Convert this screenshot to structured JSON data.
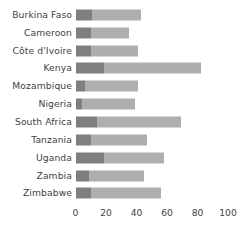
{
  "chart_data": {
    "type": "bar",
    "orientation": "horizontal",
    "stacked": true,
    "title": "",
    "subtitle": "",
    "xlabel": "",
    "ylabel": "",
    "xlim": [
      0,
      100
    ],
    "xticks": [
      0,
      20,
      40,
      60,
      80,
      100
    ],
    "xtick_labels": [
      "0",
      "20",
      "40",
      "60",
      "80",
      "100"
    ],
    "grid": false,
    "legend": "none",
    "categories": [
      "Burkina Faso",
      "Cameroon",
      "Côte d'Ivoire",
      "Kenya",
      "Mozambique",
      "Nigeria",
      "South Africa",
      "Tanzania",
      "Uganda",
      "Zambia",
      "Zimbabwe"
    ],
    "series": [
      {
        "name": "segment-1",
        "color": "#7f7f7f",
        "values": [
          11,
          10,
          10,
          19,
          6,
          4,
          14,
          10,
          19,
          9,
          10
        ]
      },
      {
        "name": "segment-2",
        "color": "#aeaeae",
        "values": [
          32,
          25,
          31,
          63,
          35,
          35,
          55,
          37,
          39,
          36,
          46
        ]
      }
    ],
    "totals": [
      43,
      35,
      41,
      82,
      41,
      39,
      69,
      47,
      58,
      45,
      56
    ]
  },
  "colors": {
    "background": "#ffffff",
    "text": "#3f3f3f",
    "segment_dark": "#7f7f7f",
    "segment_light": "#aeaeae"
  }
}
